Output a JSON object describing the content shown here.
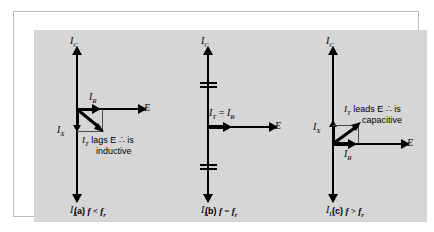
{
  "figure": {
    "background_color": "#d6d6d6",
    "frame_color": "#bdbdbd",
    "line_color": "#000000"
  },
  "panels": [
    {
      "id": "a",
      "caption_prefix": "(a)",
      "caption_expr": "f < f",
      "caption_sub": "r",
      "axis_up_label": "I",
      "axis_up_sub": "C",
      "axis_down_label": "I",
      "axis_down_sub": "L",
      "axis_right_label": "E",
      "reactive_label": "I",
      "reactive_sub": "X",
      "resistive_label": "I",
      "resistive_sub": "R",
      "total_label": "I",
      "total_sub": "T",
      "note_line1": "lags E",
      "note_therefore": "∴",
      "note_is": "is",
      "note_line2": "inductive",
      "condition": "f < fr",
      "behavior": "inductive",
      "total_current_direction": "lags"
    },
    {
      "id": "b",
      "caption_prefix": "(b)",
      "caption_expr": "f = f",
      "caption_sub": "r",
      "axis_up_label": "I",
      "axis_up_sub": "C",
      "axis_down_label": "I",
      "axis_down_sub": "L",
      "axis_right_label": "E",
      "total_eq_label_a": "I",
      "total_eq_sub_a": "T",
      "total_eq_operator": "=",
      "total_eq_label_b": "I",
      "total_eq_sub_b": "R",
      "condition": "f = fr",
      "behavior": "resistive",
      "total_current_direction": "in phase"
    },
    {
      "id": "c",
      "caption_prefix": "(c)",
      "caption_expr": "f > f",
      "caption_sub": "r",
      "axis_up_label": "I",
      "axis_up_sub": "C",
      "axis_down_label": "I",
      "axis_down_sub": "L",
      "axis_right_label": "E",
      "reactive_label": "I",
      "reactive_sub": "X",
      "resistive_label": "I",
      "resistive_sub": "R",
      "total_label": "I",
      "total_sub": "T",
      "note_line1": "leads E",
      "note_therefore": "∴",
      "note_is": "is",
      "note_line2": "capacitive",
      "condition": "f > fr",
      "behavior": "capacitive",
      "total_current_direction": "leads"
    }
  ]
}
